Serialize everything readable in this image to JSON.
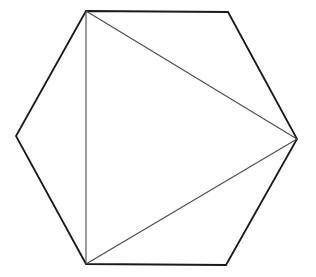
{
  "diagram": {
    "background": "#ffffff",
    "hexagon": {
      "vertices": [
        [
          86,
          11
        ],
        [
          228,
          12
        ],
        [
          297,
          139
        ],
        [
          226,
          265
        ],
        [
          86,
          264
        ],
        [
          16,
          136
        ]
      ],
      "stroke": "#1a1a1a",
      "stroke_width": 1.8
    },
    "triangle": {
      "vertices": [
        [
          86,
          11
        ],
        [
          297,
          139
        ],
        [
          86,
          264
        ]
      ],
      "stroke": "#4a4a4a",
      "stroke_width": 1.1
    }
  }
}
